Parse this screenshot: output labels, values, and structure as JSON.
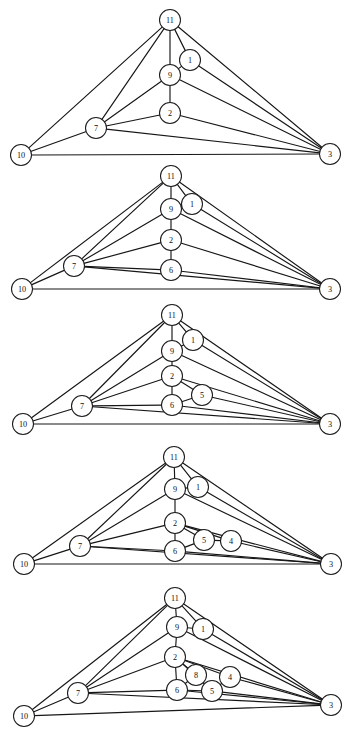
{
  "figure": {
    "background_color": "#ffffff",
    "edge_color": "#161616",
    "node_fill": "#ffffff",
    "node_stroke": "#1c1c1c",
    "label_color": "#121212",
    "panel_count": 5,
    "width": 346,
    "height": 731
  },
  "chart_data": {
    "type": "diagram",
    "subtype": "node-link-graph-sequence",
    "panels": [
      {
        "index": 1,
        "name": "graph-panel-1",
        "node_radius": 10.5,
        "nodes": [
          {
            "id": "11",
            "label": "11",
            "x": 170,
            "y": 20
          },
          {
            "id": "1",
            "label": "1",
            "x": 190,
            "y": 60
          },
          {
            "id": "9",
            "label": "9",
            "x": 170,
            "y": 75
          },
          {
            "id": "2",
            "label": "2",
            "x": 170,
            "y": 113
          },
          {
            "id": "7",
            "label": "7",
            "x": 96,
            "y": 128
          },
          {
            "id": "10",
            "label": "10",
            "x": 21,
            "y": 155
          },
          {
            "id": "3",
            "label": "3",
            "x": 330,
            "y": 154
          }
        ],
        "edges": [
          [
            "11",
            "10"
          ],
          [
            "11",
            "7"
          ],
          [
            "11",
            "9"
          ],
          [
            "11",
            "1"
          ],
          [
            "11",
            "3"
          ],
          [
            "1",
            "9"
          ],
          [
            "1",
            "3"
          ],
          [
            "9",
            "7"
          ],
          [
            "9",
            "2"
          ],
          [
            "9",
            "3"
          ],
          [
            "2",
            "7"
          ],
          [
            "2",
            "3"
          ],
          [
            "7",
            "10"
          ],
          [
            "7",
            "3"
          ],
          [
            "10",
            "3"
          ]
        ]
      },
      {
        "index": 2,
        "name": "graph-panel-2",
        "node_radius": 10.5,
        "nodes": [
          {
            "id": "11",
            "label": "11",
            "x": 171,
            "y": 176
          },
          {
            "id": "1",
            "label": "1",
            "x": 192,
            "y": 204
          },
          {
            "id": "9",
            "label": "9",
            "x": 171,
            "y": 209
          },
          {
            "id": "2",
            "label": "2",
            "x": 171,
            "y": 240
          },
          {
            "id": "6",
            "label": "6",
            "x": 171,
            "y": 270
          },
          {
            "id": "7",
            "label": "7",
            "x": 74,
            "y": 266
          },
          {
            "id": "10",
            "label": "10",
            "x": 22,
            "y": 289
          },
          {
            "id": "3",
            "label": "3",
            "x": 330,
            "y": 289
          }
        ],
        "edges": [
          [
            "11",
            "10"
          ],
          [
            "11",
            "7"
          ],
          [
            "11",
            "9"
          ],
          [
            "11",
            "1"
          ],
          [
            "11",
            "3"
          ],
          [
            "1",
            "9"
          ],
          [
            "1",
            "3"
          ],
          [
            "9",
            "7"
          ],
          [
            "9",
            "2"
          ],
          [
            "9",
            "3"
          ],
          [
            "2",
            "7"
          ],
          [
            "2",
            "6"
          ],
          [
            "2",
            "3"
          ],
          [
            "6",
            "7"
          ],
          [
            "6",
            "3"
          ],
          [
            "7",
            "10"
          ],
          [
            "7",
            "3"
          ],
          [
            "10",
            "3"
          ]
        ]
      },
      {
        "index": 3,
        "name": "graph-panel-3",
        "node_radius": 10.5,
        "nodes": [
          {
            "id": "11",
            "label": "11",
            "x": 172,
            "y": 315
          },
          {
            "id": "1",
            "label": "1",
            "x": 193,
            "y": 340
          },
          {
            "id": "9",
            "label": "9",
            "x": 172,
            "y": 351
          },
          {
            "id": "2",
            "label": "2",
            "x": 172,
            "y": 376
          },
          {
            "id": "5",
            "label": "5",
            "x": 202,
            "y": 395
          },
          {
            "id": "6",
            "label": "6",
            "x": 172,
            "y": 405
          },
          {
            "id": "7",
            "label": "7",
            "x": 82,
            "y": 406
          },
          {
            "id": "10",
            "label": "10",
            "x": 23,
            "y": 424
          },
          {
            "id": "3",
            "label": "3",
            "x": 330,
            "y": 424
          }
        ],
        "edges": [
          [
            "11",
            "10"
          ],
          [
            "11",
            "7"
          ],
          [
            "11",
            "9"
          ],
          [
            "11",
            "1"
          ],
          [
            "11",
            "3"
          ],
          [
            "1",
            "9"
          ],
          [
            "1",
            "3"
          ],
          [
            "9",
            "7"
          ],
          [
            "9",
            "2"
          ],
          [
            "9",
            "3"
          ],
          [
            "2",
            "7"
          ],
          [
            "2",
            "6"
          ],
          [
            "2",
            "5"
          ],
          [
            "2",
            "3"
          ],
          [
            "5",
            "6"
          ],
          [
            "5",
            "3"
          ],
          [
            "6",
            "7"
          ],
          [
            "6",
            "3"
          ],
          [
            "7",
            "10"
          ],
          [
            "7",
            "3"
          ],
          [
            "10",
            "3"
          ]
        ]
      },
      {
        "index": 4,
        "name": "graph-panel-4",
        "node_radius": 10.5,
        "nodes": [
          {
            "id": "11",
            "label": "11",
            "x": 174,
            "y": 457
          },
          {
            "id": "1",
            "label": "1",
            "x": 198,
            "y": 487
          },
          {
            "id": "9",
            "label": "9",
            "x": 175,
            "y": 489
          },
          {
            "id": "2",
            "label": "2",
            "x": 175,
            "y": 523
          },
          {
            "id": "5",
            "label": "5",
            "x": 204,
            "y": 540
          },
          {
            "id": "4",
            "label": "4",
            "x": 231,
            "y": 541
          },
          {
            "id": "6",
            "label": "6",
            "x": 175,
            "y": 551
          },
          {
            "id": "7",
            "label": "7",
            "x": 80,
            "y": 546
          },
          {
            "id": "10",
            "label": "10",
            "x": 24,
            "y": 564
          },
          {
            "id": "3",
            "label": "3",
            "x": 331,
            "y": 564
          }
        ],
        "edges": [
          [
            "11",
            "10"
          ],
          [
            "11",
            "7"
          ],
          [
            "11",
            "9"
          ],
          [
            "11",
            "1"
          ],
          [
            "11",
            "3"
          ],
          [
            "1",
            "9"
          ],
          [
            "1",
            "3"
          ],
          [
            "9",
            "7"
          ],
          [
            "9",
            "2"
          ],
          [
            "9",
            "3"
          ],
          [
            "2",
            "7"
          ],
          [
            "2",
            "6"
          ],
          [
            "2",
            "5"
          ],
          [
            "2",
            "4"
          ],
          [
            "2",
            "3"
          ],
          [
            "5",
            "6"
          ],
          [
            "5",
            "4"
          ],
          [
            "4",
            "3"
          ],
          [
            "6",
            "7"
          ],
          [
            "6",
            "3"
          ],
          [
            "7",
            "10"
          ],
          [
            "7",
            "3"
          ],
          [
            "10",
            "3"
          ]
        ]
      },
      {
        "index": 5,
        "name": "graph-panel-5",
        "node_radius": 10.5,
        "nodes": [
          {
            "id": "11",
            "label": "11",
            "x": 175,
            "y": 598
          },
          {
            "id": "9",
            "label": "9",
            "x": 177,
            "y": 627
          },
          {
            "id": "1",
            "label": "1",
            "x": 203,
            "y": 629
          },
          {
            "id": "2",
            "label": "2",
            "x": 175,
            "y": 657
          },
          {
            "id": "8",
            "label": "8",
            "x": 196,
            "y": 675
          },
          {
            "id": "4",
            "label": "4",
            "x": 230,
            "y": 677
          },
          {
            "id": "6",
            "label": "6",
            "x": 177,
            "y": 690
          },
          {
            "id": "5",
            "label": "5",
            "x": 212,
            "y": 691
          },
          {
            "id": "7",
            "label": "7",
            "x": 78,
            "y": 693
          },
          {
            "id": "10",
            "label": "10",
            "x": 24,
            "y": 716
          },
          {
            "id": "3",
            "label": "3",
            "x": 331,
            "y": 705
          }
        ],
        "edges": [
          [
            "11",
            "10"
          ],
          [
            "11",
            "7"
          ],
          [
            "11",
            "9"
          ],
          [
            "11",
            "1"
          ],
          [
            "11",
            "3"
          ],
          [
            "1",
            "9"
          ],
          [
            "1",
            "3"
          ],
          [
            "9",
            "7"
          ],
          [
            "9",
            "2"
          ],
          [
            "9",
            "3"
          ],
          [
            "2",
            "7"
          ],
          [
            "2",
            "6"
          ],
          [
            "2",
            "8"
          ],
          [
            "2",
            "4"
          ],
          [
            "2",
            "5"
          ],
          [
            "2",
            "3"
          ],
          [
            "8",
            "6"
          ],
          [
            "8",
            "5"
          ],
          [
            "5",
            "6"
          ],
          [
            "5",
            "4"
          ],
          [
            "5",
            "3"
          ],
          [
            "4",
            "3"
          ],
          [
            "6",
            "7"
          ],
          [
            "6",
            "3"
          ],
          [
            "7",
            "10"
          ],
          [
            "7",
            "3"
          ],
          [
            "10",
            "3"
          ]
        ]
      }
    ]
  }
}
